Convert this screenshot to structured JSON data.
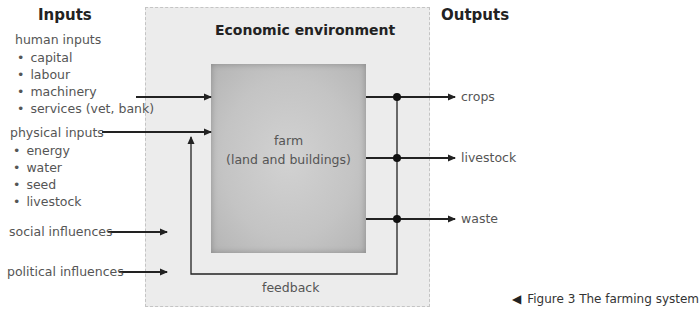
{
  "figure": {
    "caption_marker": "◀",
    "caption": "Figure 3 The farming system"
  },
  "inputs": {
    "heading": "Inputs",
    "human": {
      "label": "human inputs",
      "items": [
        "capital",
        "labour",
        "machinery",
        "services (vet, bank)"
      ]
    },
    "physical": {
      "label": "physical inputs",
      "items": [
        "energy",
        "water",
        "seed",
        "livestock"
      ]
    },
    "social": "social influences",
    "political": "political influences"
  },
  "environment": {
    "title": "Economic environment"
  },
  "farm": {
    "line1": "farm",
    "line2": "(land and buildings)"
  },
  "feedback": {
    "label": "feedback"
  },
  "outputs": {
    "heading": "Outputs",
    "items": [
      "crops",
      "livestock",
      "waste"
    ]
  },
  "colors": {
    "environment_fill": "#ececec",
    "environment_border": "#c4c4c4",
    "farm_fill": "#c8c8c8",
    "arrow": "#222222",
    "text": "#555555"
  }
}
